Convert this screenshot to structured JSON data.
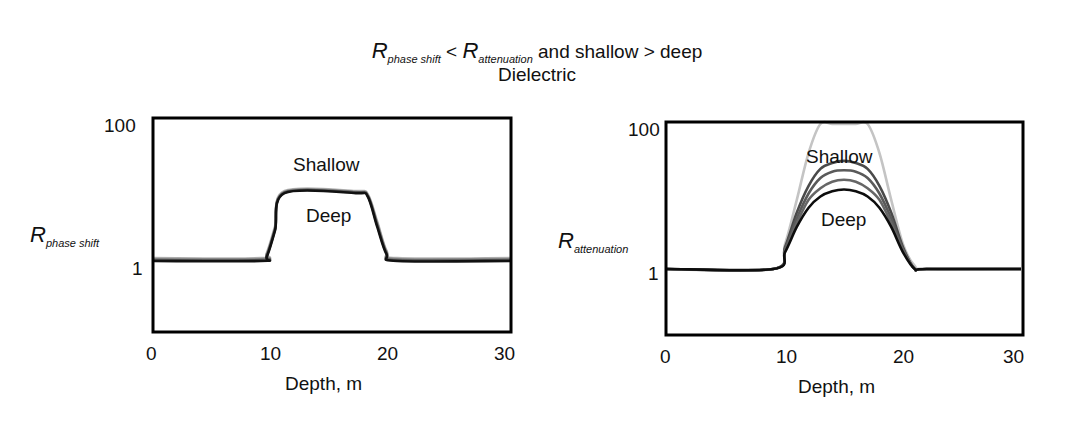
{
  "title": {
    "line1": {
      "r1_main": "R",
      "r1_sub": "phase shift",
      "op": " < ",
      "r2_main": "R",
      "r2_sub": "attenuation",
      "rest": " and shallow > deep"
    },
    "line2": "Dielectric"
  },
  "chart_data": [
    {
      "type": "line",
      "title": "R_phase shift < R_attenuation and shallow > deep — Dielectric",
      "panel": "left",
      "xlabel": "Depth, m",
      "ylabel": "R_phase shift",
      "ylabel_main": "R",
      "ylabel_sub": "phase shift",
      "xlim": [
        0,
        30
      ],
      "ylim_labels": [
        "1",
        "100"
      ],
      "yscale": "log",
      "xticks": [
        "0",
        "10",
        "20",
        "30"
      ],
      "yticks": [
        "100",
        "1"
      ],
      "grid": false,
      "annotations": [
        "Shallow",
        "Deep"
      ],
      "x": [
        0,
        9,
        9.5,
        10.2,
        11,
        17,
        18,
        18.8,
        19.6,
        20.5,
        30
      ],
      "series": [
        {
          "name": "Shallow",
          "color": "#b8b8b8",
          "values": [
            1.1,
            1.1,
            1.3,
            3.2,
            10.5,
            10.5,
            9.5,
            3.8,
            1.4,
            1.1,
            1.1
          ]
        },
        {
          "name": "curve-2",
          "color": "#8a8a8a",
          "values": [
            1.07,
            1.07,
            1.25,
            3.0,
            10.2,
            10.2,
            9.2,
            3.6,
            1.35,
            1.07,
            1.07
          ]
        },
        {
          "name": "curve-3",
          "color": "#5a5a5a",
          "values": [
            1.03,
            1.03,
            1.2,
            2.9,
            10.0,
            10.0,
            9.0,
            3.4,
            1.3,
            1.03,
            1.03
          ]
        },
        {
          "name": "Deep",
          "color": "#111111",
          "values": [
            1.0,
            1.0,
            1.15,
            2.8,
            9.8,
            9.8,
            8.8,
            3.2,
            1.25,
            1.0,
            1.0
          ]
        }
      ]
    },
    {
      "type": "line",
      "panel": "right",
      "xlabel": "Depth, m",
      "ylabel": "R_attenuation",
      "ylabel_main": "R",
      "ylabel_sub": "attenuation",
      "xlim": [
        0,
        30
      ],
      "ylim_labels": [
        "1",
        "100"
      ],
      "yscale": "log",
      "xticks": [
        "0",
        "10",
        "20",
        "30"
      ],
      "yticks": [
        "100",
        "1"
      ],
      "grid": false,
      "annotations": [
        "Shallow",
        "Deep"
      ],
      "x": [
        0,
        9,
        10,
        11,
        12,
        13,
        14,
        15,
        16,
        17,
        18,
        19,
        20,
        21,
        22,
        30
      ],
      "series": [
        {
          "name": "Shallow (envelope)",
          "color": "#c4c4c4",
          "values": [
            1,
            1,
            2.2,
            9,
            40,
            100,
            100,
            100,
            100,
            100,
            40,
            9,
            2.2,
            1.1,
            1,
            1
          ]
        },
        {
          "name": "curve-2",
          "color": "#4a4a4a",
          "values": [
            1,
            1,
            2.0,
            6,
            14,
            24,
            29,
            31,
            29,
            24,
            14,
            6,
            2.0,
            1,
            1,
            1
          ]
        },
        {
          "name": "curve-3",
          "color": "#5a5a5a",
          "values": [
            1,
            1,
            1.9,
            5,
            11,
            18,
            22,
            23,
            22,
            18,
            11,
            5,
            1.9,
            1,
            1,
            1
          ]
        },
        {
          "name": "curve-4",
          "color": "#666666",
          "values": [
            1,
            1,
            1.8,
            4.3,
            9,
            13,
            16,
            17,
            16,
            13,
            9,
            4.3,
            1.8,
            1,
            1,
            1
          ]
        },
        {
          "name": "Deep",
          "color": "#0d0d0d",
          "values": [
            1,
            1,
            1.7,
            3.8,
            7,
            10,
            11.8,
            12.5,
            11.8,
            10,
            7,
            3.8,
            1.7,
            1,
            1,
            1
          ]
        }
      ]
    }
  ],
  "left_plot": {
    "ytick_top": "100",
    "ytick_one": "1",
    "xticks": [
      "0",
      "10",
      "20",
      "30"
    ],
    "xlabel": "Depth, m",
    "ylabel_main": "R",
    "ylabel_sub": "phase shift",
    "label_shallow": "Shallow",
    "label_deep": "Deep"
  },
  "right_plot": {
    "ytick_top": "100",
    "ytick_one": "1",
    "xticks": [
      "0",
      "10",
      "20",
      "30"
    ],
    "xlabel": "Depth, m",
    "ylabel_main": "R",
    "ylabel_sub": "attenuation",
    "label_shallow": "Shallow",
    "label_deep": "Deep"
  }
}
